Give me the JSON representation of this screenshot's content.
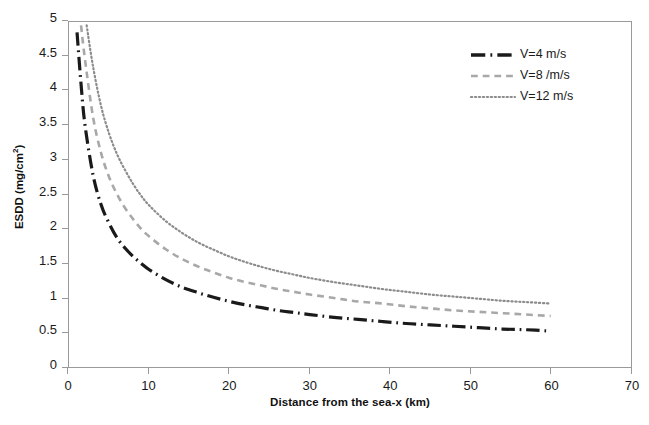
{
  "chart_data": {
    "type": "line",
    "title": "",
    "xlabel": "Distance from the sea-x (km)",
    "ylabel": "ESDD (mg/cm2)",
    "ylabel_display": "ESDD (mg/cm",
    "ylabel_exponent": "2",
    "ylabel_suffix": ")",
    "xlim": [
      0,
      70
    ],
    "ylim": [
      0,
      5
    ],
    "xticks": [
      0,
      10,
      20,
      30,
      40,
      50,
      60,
      70
    ],
    "yticks": [
      0,
      0.5,
      1,
      1.5,
      2,
      2.5,
      3,
      3.5,
      4,
      4.5,
      5
    ],
    "xtick_labels": [
      "0",
      "10",
      "20",
      "30",
      "40",
      "50",
      "60",
      "70"
    ],
    "ytick_labels": [
      "0",
      "0.5",
      "1",
      "1.5",
      "2",
      "2.5",
      "3",
      "3.5",
      "4",
      "4.5",
      "5"
    ],
    "grid": false,
    "legend_position": "top-right",
    "series": [
      {
        "name": "V=4 m/s",
        "color": "#1a1a1a",
        "linestyle": "dashdot",
        "linewidth": 3.2,
        "x": [
          1.0,
          1.5,
          2,
          3,
          4,
          5,
          6,
          7,
          8,
          9,
          10,
          12,
          14,
          16,
          18,
          20,
          22,
          24,
          26,
          28,
          30,
          33,
          36,
          39,
          42,
          45,
          48,
          51,
          54,
          57,
          60
        ],
        "y": [
          4.85,
          4.1,
          3.5,
          2.78,
          2.35,
          2.08,
          1.87,
          1.72,
          1.6,
          1.5,
          1.41,
          1.27,
          1.16,
          1.08,
          1.01,
          0.95,
          0.9,
          0.86,
          0.82,
          0.79,
          0.76,
          0.72,
          0.69,
          0.66,
          0.63,
          0.61,
          0.59,
          0.57,
          0.55,
          0.54,
          0.52
        ]
      },
      {
        "name": "V=8 /m/s",
        "color": "#a8a8a8",
        "linestyle": "dashed",
        "linewidth": 2.6,
        "x": [
          1.5,
          2,
          3,
          4,
          5,
          6,
          7,
          8,
          9,
          10,
          12,
          14,
          16,
          18,
          20,
          22,
          24,
          26,
          28,
          30,
          33,
          36,
          39,
          42,
          45,
          48,
          51,
          54,
          57,
          60
        ],
        "y": [
          4.95,
          4.45,
          3.62,
          3.1,
          2.75,
          2.5,
          2.3,
          2.14,
          2.0,
          1.89,
          1.71,
          1.57,
          1.46,
          1.37,
          1.29,
          1.23,
          1.18,
          1.13,
          1.09,
          1.05,
          1.0,
          0.95,
          0.92,
          0.88,
          0.85,
          0.82,
          0.8,
          0.78,
          0.76,
          0.74
        ]
      },
      {
        "name": "V=12 m/s",
        "color": "#8c8c8c",
        "linestyle": "dotted",
        "linewidth": 2.2,
        "x": [
          2.2,
          3,
          4,
          5,
          6,
          7,
          8,
          9,
          10,
          12,
          14,
          16,
          18,
          20,
          22,
          24,
          26,
          28,
          30,
          33,
          36,
          39,
          42,
          45,
          48,
          51,
          54,
          57,
          60
        ],
        "y": [
          4.95,
          4.35,
          3.78,
          3.38,
          3.08,
          2.85,
          2.65,
          2.48,
          2.34,
          2.12,
          1.95,
          1.81,
          1.7,
          1.6,
          1.52,
          1.45,
          1.39,
          1.34,
          1.29,
          1.23,
          1.18,
          1.13,
          1.09,
          1.05,
          1.02,
          0.99,
          0.96,
          0.94,
          0.92
        ]
      }
    ]
  },
  "legend": {
    "items": [
      {
        "label": "V=4 m/s",
        "style": "dashdot",
        "color": "#1a1a1a"
      },
      {
        "label": "V=8 /m/s",
        "style": "dashed",
        "color": "#a8a8a8"
      },
      {
        "label": "V=12 m/s",
        "style": "dotted",
        "color": "#8c8c8c"
      }
    ]
  },
  "colors": {
    "axis": "#9a9a9a",
    "text": "#1a1a1a",
    "background": "#ffffff"
  }
}
